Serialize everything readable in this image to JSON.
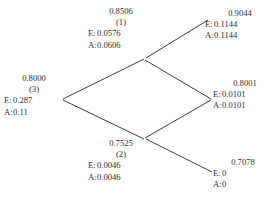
{
  "diagram": {
    "type": "probability-lattice-tree",
    "line_color": "#3a3a3a",
    "text_color": "#2b2b2b",
    "background": "#ffffff",
    "labels": {
      "e_label": "E:",
      "a_label": "A:"
    },
    "nodes": [
      {
        "id": "root",
        "position": "left",
        "probability": "0.8000",
        "index": "(3)",
        "e_value": "0.287",
        "a_value": "0.11"
      },
      {
        "id": "upper",
        "position": "top-middle",
        "probability": "0.8506",
        "index": "(1)",
        "e_value": "0.0576",
        "a_value": "0.0606"
      },
      {
        "id": "lower",
        "position": "bottom-middle",
        "probability": "0.7525",
        "index": "(2)",
        "e_value": "0.0046",
        "a_value": "0.0046"
      },
      {
        "id": "top-right",
        "position": "top-right",
        "probability": "0.9044",
        "index": "",
        "e_value": "0.1144",
        "a_value": "0.1144"
      },
      {
        "id": "middle-right",
        "position": "middle-right",
        "probability": "0.8001",
        "index": "",
        "e_value": "0.0101",
        "a_value": "0.0101"
      },
      {
        "id": "bottom-right",
        "position": "bottom-right",
        "probability": "0.7078",
        "index": "",
        "e_value": "0",
        "a_value": "0"
      }
    ],
    "edges": [
      {
        "from": "root",
        "to": "upper"
      },
      {
        "from": "root",
        "to": "lower"
      },
      {
        "from": "upper",
        "to": "top-right"
      },
      {
        "from": "upper",
        "to": "middle-right"
      },
      {
        "from": "lower",
        "to": "middle-right"
      },
      {
        "from": "lower",
        "to": "bottom-right"
      }
    ]
  }
}
